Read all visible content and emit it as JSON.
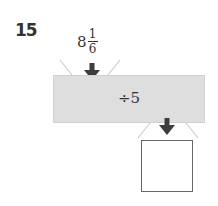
{
  "problem": {
    "number": "15",
    "input": {
      "whole": "8",
      "numerator": "1",
      "denominator": "6"
    },
    "operation": "÷5",
    "output": ""
  },
  "colors": {
    "machine_fill": "#dedede",
    "arrow": "#3d3d3d",
    "funnel_lines": "#cccccc"
  },
  "icons": {
    "input_arrow": "arrow-down-icon",
    "output_arrow": "arrow-down-icon"
  }
}
